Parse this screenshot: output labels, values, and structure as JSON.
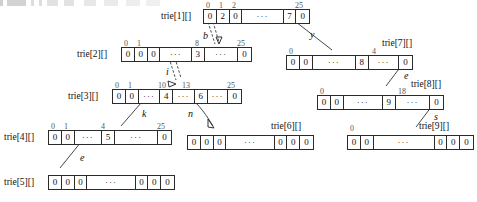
{
  "diagram": {
    "arrays": [
      {
        "id": "trie1",
        "label": "trie[1][]",
        "indices": [
          {
            "text": "0",
            "cell": 0
          },
          {
            "text": "1",
            "cell": 1
          },
          {
            "text": "2",
            "cell": 2
          },
          {
            "text": "25",
            "cell": 5
          }
        ],
        "cells": [
          "0",
          "2",
          "0",
          "···",
          "7",
          "0"
        ]
      },
      {
        "id": "trie2",
        "label": "trie[2][]",
        "indices": [
          {
            "text": "0",
            "cell": 0
          },
          {
            "text": "1",
            "cell": 1
          },
          {
            "text": "8",
            "cell": 4
          },
          {
            "text": "25",
            "cell": 6
          }
        ],
        "cells": [
          "0",
          "0",
          "0",
          "···",
          "3",
          "···",
          "0"
        ]
      },
      {
        "id": "trie3",
        "label": "trie[3][]",
        "indices": [
          {
            "text": "0",
            "cell": 0
          },
          {
            "text": "1",
            "cell": 1
          },
          {
            "text": "10",
            "cell": 3
          },
          {
            "text": "13",
            "cell": 5
          },
          {
            "text": "25",
            "cell": 7
          }
        ],
        "cells": [
          "0",
          "0",
          "···",
          "4",
          "···",
          "6",
          "···",
          "0"
        ]
      },
      {
        "id": "trie4",
        "label": "trie[4][]",
        "indices": [
          {
            "text": "0",
            "cell": 0
          },
          {
            "text": "1",
            "cell": 1
          },
          {
            "text": "4",
            "cell": 3
          },
          {
            "text": "25",
            "cell": 5
          }
        ],
        "cells": [
          "0",
          "0",
          "···",
          "5",
          "···",
          "0"
        ]
      },
      {
        "id": "trie5",
        "label": "trie[5][]",
        "indices": [],
        "cells": [
          "0",
          "0",
          "0",
          "···",
          "0",
          "0",
          "0"
        ]
      },
      {
        "id": "trie6",
        "label": "trie[6][]",
        "indices": [],
        "cells": [
          "0",
          "0",
          "0",
          "···",
          "0",
          "0",
          "0"
        ]
      },
      {
        "id": "trie7",
        "label": "trie[7][]",
        "indices": [
          {
            "text": "0",
            "cell": 0
          },
          {
            "text": "4",
            "cell": 3
          }
        ],
        "cells": [
          "0",
          "0",
          "···",
          "8",
          "···",
          "0"
        ]
      },
      {
        "id": "trie8",
        "label": "trie[8][]",
        "indices": [
          {
            "text": "0",
            "cell": 0
          },
          {
            "text": "18",
            "cell": 3
          }
        ],
        "cells": [
          "0",
          "0",
          "···",
          "9",
          "···",
          "0"
        ]
      },
      {
        "id": "trie9",
        "label": "trie[9][]",
        "indices": [
          {
            "text": "0",
            "cell": 0
          }
        ],
        "cells": [
          "0",
          "0",
          "···",
          "0",
          "0",
          "0"
        ]
      }
    ],
    "edges": [
      {
        "id": "edge-b",
        "label": "b",
        "from": "trie1",
        "to": "trie2"
      },
      {
        "id": "edge-y",
        "label": "y",
        "from": "trie1",
        "to": "trie7"
      },
      {
        "id": "edge-i",
        "label": "i",
        "from": "trie2",
        "to": "trie3"
      },
      {
        "id": "edge-k",
        "label": "k",
        "from": "trie3",
        "to": "trie4"
      },
      {
        "id": "edge-n",
        "label": "n",
        "from": "trie3",
        "to": "trie6"
      },
      {
        "id": "edge-e1",
        "label": "e",
        "from": "trie4",
        "to": "trie5"
      },
      {
        "id": "edge-e2",
        "label": "e",
        "from": "trie7",
        "to": "trie8"
      },
      {
        "id": "edge-s",
        "label": "s",
        "from": "trie8",
        "to": "trie9"
      }
    ],
    "colors": {
      "ink": "#2b2b2b",
      "index_text": "#555555",
      "background": "#ffffff"
    }
  }
}
